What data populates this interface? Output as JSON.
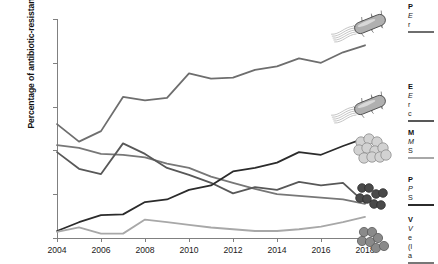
{
  "chart_data": {
    "type": "line",
    "title": "",
    "xlabel": "",
    "ylabel": "Percentage of antibiotic-resistant bacteria",
    "x": [
      2004,
      2005,
      2006,
      2007,
      2008,
      2009,
      2010,
      2011,
      2012,
      2013,
      2014,
      2015,
      2016,
      2017,
      2018
    ],
    "xlim": [
      2004,
      2018
    ],
    "ylim": [
      0,
      25
    ],
    "ytick_labels": [
      "0%",
      "5%",
      "10%",
      "15%",
      "20%",
      "25%"
    ],
    "ytick_values": [
      0,
      5,
      10,
      15,
      20,
      25
    ],
    "xtick_labels": [
      "2004",
      "2006",
      "2008",
      "2010",
      "2012",
      "2014",
      "2016",
      "2018"
    ],
    "xtick_values": [
      2004,
      2006,
      2008,
      2010,
      2012,
      2014,
      2016,
      2018
    ],
    "grid": false,
    "legend_position": "right",
    "series": [
      {
        "name": "series-1-dark-gray-rising-top",
        "color": "#6e6e6e",
        "values": [
          13.0,
          11.0,
          12.2,
          16.1,
          15.7,
          16.0,
          18.8,
          18.2,
          18.3,
          19.2,
          19.6,
          20.5,
          20.0,
          21.2,
          22.0
        ]
      },
      {
        "name": "series-2-medium-gray-declining",
        "color": "#777777",
        "values": [
          10.6,
          10.3,
          9.6,
          9.5,
          9.2,
          8.5,
          8.0,
          7.0,
          6.3,
          5.6,
          5.0,
          4.8,
          4.6,
          4.4,
          3.9
        ]
      },
      {
        "name": "series-3-mid-gray-peak-2007",
        "color": "#585858",
        "values": [
          9.8,
          7.9,
          7.3,
          10.8,
          9.6,
          8.0,
          7.2,
          6.3,
          5.1,
          5.8,
          5.5,
          6.4,
          6.0,
          6.3,
          4.0
        ]
      },
      {
        "name": "series-4-black-rising",
        "color": "#2b2b2b",
        "values": [
          0.8,
          1.8,
          2.6,
          2.7,
          4.1,
          4.4,
          5.5,
          6.0,
          7.6,
          8.0,
          8.6,
          9.8,
          9.5,
          10.5,
          11.4
        ]
      },
      {
        "name": "series-5-light-gray-low",
        "color": "#a8a8a8",
        "values": [
          0.7,
          1.2,
          0.5,
          0.5,
          2.1,
          1.8,
          1.5,
          1.2,
          1.0,
          0.8,
          0.8,
          1.0,
          1.3,
          1.8,
          2.4
        ]
      }
    ]
  },
  "legend": {
    "entries": [
      {
        "icon": "rod-bacterium-with-flagella-icon",
        "name": "P",
        "species": "E",
        "antibiotic": "r",
        "color": "#6e6e6e"
      },
      {
        "icon": "rod-bacterium-with-flagella-icon",
        "name": "E",
        "species": "E",
        "antibiotic": "r",
        "antibiotic2": "c",
        "color": "#585858"
      },
      {
        "icon": "cocci-cluster-light-icon",
        "name": "M",
        "species": "M",
        "antibiotic": "S",
        "color": "#a8a8a8"
      },
      {
        "icon": "cocci-pairs-dark-icon",
        "name": "P",
        "species": "P",
        "antibiotic": "S",
        "color": "#2b2b2b"
      },
      {
        "icon": "cocci-chain-icon",
        "name": "V",
        "species": "V",
        "antibiotic": "e",
        "antibiotic2": "(l",
        "antibiotic3": "a",
        "color": "#777777"
      }
    ]
  }
}
